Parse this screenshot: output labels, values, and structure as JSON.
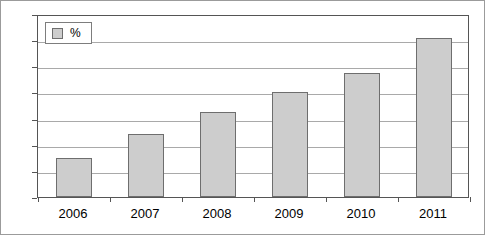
{
  "chart_data": {
    "type": "bar",
    "title": "",
    "subtitle": "",
    "xlabel": "",
    "ylabel": "",
    "categories": [
      "2006",
      "2007",
      "2008",
      "2009",
      "2010",
      "2011"
    ],
    "series": [
      {
        "name": "%",
        "values": [
          3.0,
          4.8,
          6.5,
          8.0,
          9.5,
          12.2
        ]
      }
    ],
    "ylim": [
      0,
      14
    ],
    "ytick_values": [
      0,
      2,
      4,
      6,
      8,
      10,
      12,
      14
    ],
    "ytick_labels": [
      "0",
      "2",
      "4",
      "6",
      "8",
      "10",
      "12",
      "14"
    ],
    "grid": "horizontal",
    "legend_position": "top-left-inside",
    "legend_entries": [
      "%"
    ],
    "colors": {
      "bar_fill": "#cdcdcd",
      "bar_border": "#6e6e6e",
      "gridline": "#a9a9a9",
      "axis": "#555555",
      "background": "#ffffff",
      "text": "#000000"
    }
  },
  "legend": {
    "swatch_name": "percent-swatch",
    "label": "%"
  }
}
